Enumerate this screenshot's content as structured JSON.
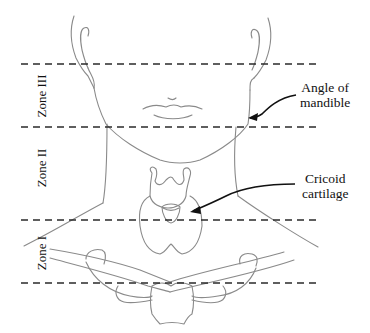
{
  "diagram": {
    "zones": [
      {
        "id": "zone-3",
        "label": "Zone III",
        "y_top": 64,
        "y_bottom": 127
      },
      {
        "id": "zone-2",
        "label": "Zone II",
        "y_top": 127,
        "y_bottom": 220
      },
      {
        "id": "zone-1",
        "label": "Zone I",
        "y_top": 220,
        "y_bottom": 283
      }
    ],
    "boundary_lines_y": [
      64,
      127,
      220,
      283
    ],
    "annotations": [
      {
        "id": "angle-of-mandible",
        "line1": "Angle of",
        "line2": "mandible"
      },
      {
        "id": "cricoid-cartilage",
        "line1": "Cricoid",
        "line2": "cartilage"
      }
    ],
    "colors": {
      "outline": "#8a8a8a",
      "dash": "#2a2a2a",
      "text": "#111111",
      "background": "#ffffff"
    }
  }
}
